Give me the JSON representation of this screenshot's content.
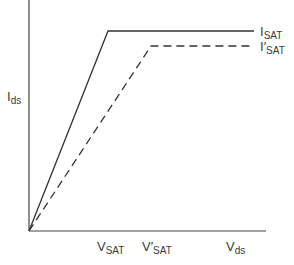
{
  "diagram": {
    "type": "ids-vds-saturation-characteristic",
    "y_axis": {
      "label_main": "I",
      "label_sub": "ds"
    },
    "x_axis": {
      "label_main": "V",
      "label_sub": "ds"
    },
    "x_ticks": [
      {
        "main": "V",
        "prime": "",
        "sub": "SAT"
      },
      {
        "main": "V",
        "prime": "′",
        "sub": "SAT"
      }
    ],
    "curves": [
      {
        "name": "I_SAT",
        "style": "solid",
        "label_main": "I",
        "label_prime": "",
        "label_sub": "SAT"
      },
      {
        "name": "I'_SAT",
        "style": "dashed",
        "label_main": "I",
        "label_prime": "′",
        "label_sub": "SAT"
      }
    ],
    "colors": {
      "line": "#3a3a3a",
      "background": "#ffffff"
    }
  }
}
